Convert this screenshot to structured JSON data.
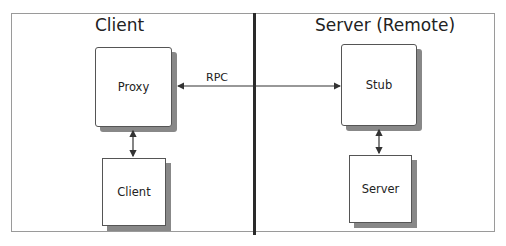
{
  "diagram": {
    "sections": [
      {
        "id": "client",
        "title": "Client"
      },
      {
        "id": "server",
        "title": "Server (Remote)"
      }
    ],
    "nodes": {
      "proxy": "Proxy",
      "client": "Client",
      "stub": "Stub",
      "server": "Server"
    },
    "edges": [
      {
        "from": "stub",
        "to": "proxy",
        "label": "RPC",
        "bidirectional": true
      },
      {
        "from": "proxy",
        "to": "client",
        "label": "",
        "bidirectional": true
      },
      {
        "from": "stub",
        "to": "server",
        "label": "",
        "bidirectional": true
      }
    ],
    "rpc_label": "RPC"
  }
}
